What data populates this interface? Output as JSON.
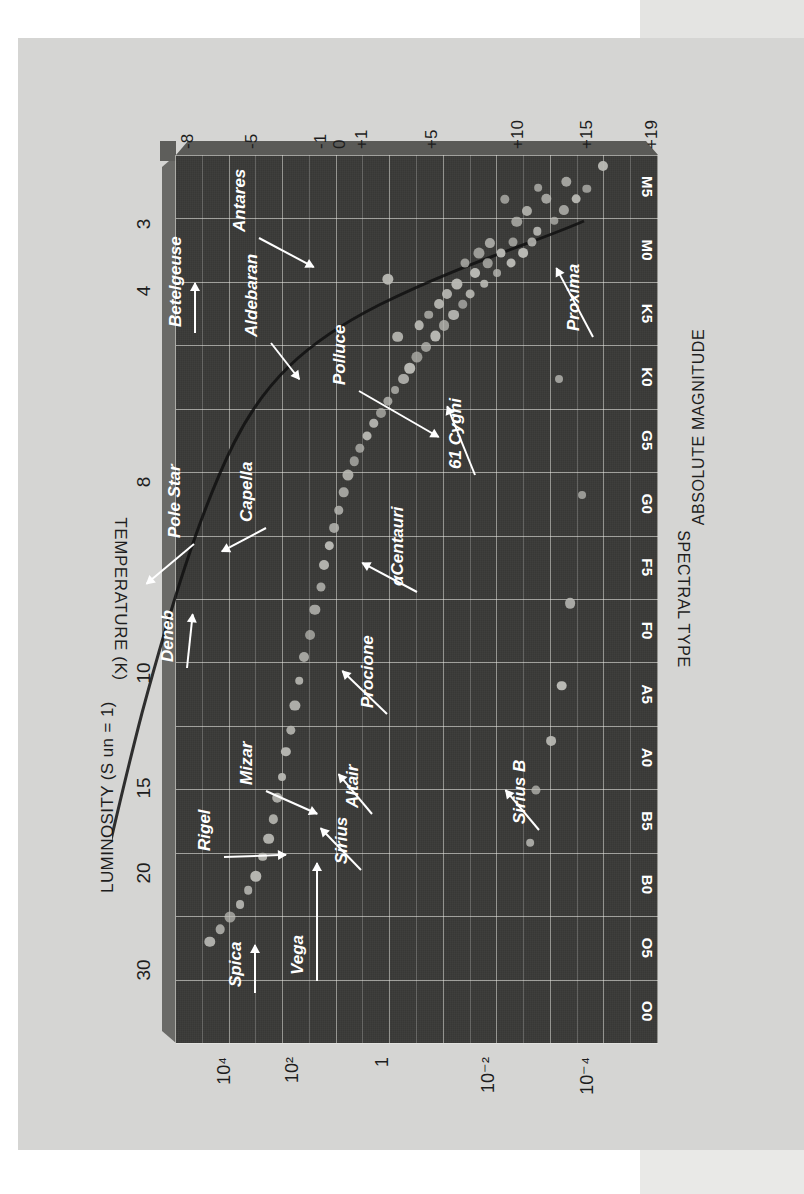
{
  "figure": {
    "title_spectral": "SPECTRAL TYPE",
    "title_absmag": "ABSOLUTE MAGNITUDE",
    "title_temp": "TEMPERATURE (K)",
    "title_lum": "LUMINOSITY (S un = 1)"
  },
  "chart_data": {
    "type": "scatter",
    "title": "",
    "xlabel": "SPECTRAL TYPE",
    "ylabel": "ABSOLUTE MAGNITUDE",
    "xlabel_secondary": "TEMPERATURE (K)",
    "ylabel_secondary": "LUMINOSITY (S un = 1)",
    "grid": true,
    "legend": "none",
    "spectral_types": [
      "M5",
      "M0",
      "K5",
      "K0",
      "G5",
      "G0",
      "F5",
      "F0",
      "A5",
      "A0",
      "B5",
      "B0",
      "O5",
      "O0"
    ],
    "absolute_magnitude_ticks": [
      "+19",
      "+15",
      "+10",
      "+5",
      "+1",
      "0",
      "-1",
      "-5",
      "-8"
    ],
    "absolute_magnitude_values": [
      19,
      15,
      10,
      5,
      1,
      0,
      -1,
      -5,
      -8
    ],
    "luminosity_ticks": [
      "10⁻⁴",
      "10⁻²",
      "1",
      "10²",
      "10⁴"
    ],
    "temperature_ticks": [
      "3",
      "4",
      "8",
      "10",
      "15",
      "20",
      "30"
    ],
    "ylim_magnitude": [
      19,
      -8
    ],
    "named_stars": [
      {
        "name": "Proxima",
        "spectral": "M5",
        "magnitude": 15.5
      },
      {
        "name": "Sirius B",
        "spectral": "A5",
        "magnitude": 11.4
      },
      {
        "name": "61 Cygni",
        "spectral": "K5",
        "magnitude": 7.5
      },
      {
        "name": "αCentauri",
        "spectral": "G0",
        "magnitude": 4.4
      },
      {
        "name": "Procione",
        "spectral": "F5",
        "magnitude": 2.7
      },
      {
        "name": "Altair",
        "spectral": "A5",
        "magnitude": 2.2
      },
      {
        "name": "Sirius",
        "spectral": "A0",
        "magnitude": 1.4
      },
      {
        "name": "Vega",
        "spectral": "A0",
        "magnitude": 0.5
      },
      {
        "name": "Mizar",
        "spectral": "A0",
        "magnitude": 0.3
      },
      {
        "name": "Polluce",
        "spectral": "K0",
        "magnitude": 1.0
      },
      {
        "name": "Aldebaran",
        "spectral": "K5",
        "magnitude": -0.7
      },
      {
        "name": "Capella",
        "spectral": "G5",
        "magnitude": -0.6
      },
      {
        "name": "Antares",
        "spectral": "M0",
        "magnitude": -4.5
      },
      {
        "name": "Betelgeuse",
        "spectral": "M0",
        "magnitude": -5.6
      },
      {
        "name": "Pole Star",
        "spectral": "F5",
        "magnitude": -4.6
      },
      {
        "name": "Deneb",
        "spectral": "A0",
        "magnitude": -7.2
      },
      {
        "name": "Rigel",
        "spectral": "B5",
        "magnitude": -7.1
      },
      {
        "name": "Spica",
        "spectral": "B0",
        "magnitude": -3.4
      }
    ],
    "points": [
      [
        0.012,
        0.115
      ],
      [
        0.038,
        0.148
      ],
      [
        0.049,
        0.17
      ],
      [
        0.03,
        0.19
      ],
      [
        0.062,
        0.196
      ],
      [
        0.074,
        0.215
      ],
      [
        0.049,
        0.232
      ],
      [
        0.037,
        0.248
      ],
      [
        0.086,
        0.25
      ],
      [
        0.098,
        0.262
      ],
      [
        0.063,
        0.272
      ],
      [
        0.11,
        0.28
      ],
      [
        0.075,
        0.293
      ],
      [
        0.098,
        0.3
      ],
      [
        0.122,
        0.305
      ],
      [
        0.05,
        0.318
      ],
      [
        0.11,
        0.325
      ],
      [
        0.133,
        0.334
      ],
      [
        0.099,
        0.348
      ],
      [
        0.122,
        0.353
      ],
      [
        0.145,
        0.36
      ],
      [
        0.11,
        0.372
      ],
      [
        0.133,
        0.38
      ],
      [
        0.156,
        0.39
      ],
      [
        0.122,
        0.4
      ],
      [
        0.168,
        0.405
      ],
      [
        0.145,
        0.418
      ],
      [
        0.18,
        0.424
      ],
      [
        0.156,
        0.438
      ],
      [
        0.192,
        0.444
      ],
      [
        0.168,
        0.455
      ],
      [
        0.204,
        0.462
      ],
      [
        0.18,
        0.476
      ],
      [
        0.216,
        0.482
      ],
      [
        0.192,
        0.495
      ],
      [
        0.228,
        0.5
      ],
      [
        0.24,
        0.515
      ],
      [
        0.252,
        0.528
      ],
      [
        0.205,
        0.54
      ],
      [
        0.265,
        0.546
      ],
      [
        0.277,
        0.56
      ],
      [
        0.29,
        0.574
      ],
      [
        0.302,
        0.59
      ],
      [
        0.316,
        0.604
      ],
      [
        0.33,
        0.618
      ],
      [
        0.345,
        0.63
      ],
      [
        0.36,
        0.644
      ],
      [
        0.38,
        0.652
      ],
      [
        0.4,
        0.662
      ],
      [
        0.42,
        0.672
      ],
      [
        0.44,
        0.682
      ],
      [
        0.462,
        0.692
      ],
      [
        0.486,
        0.7
      ],
      [
        0.512,
        0.712
      ],
      [
        0.54,
        0.722
      ],
      [
        0.565,
        0.734
      ],
      [
        0.592,
        0.744
      ],
      [
        0.62,
        0.754
      ],
      [
        0.648,
        0.762
      ],
      [
        0.672,
        0.772
      ],
      [
        0.7,
        0.78
      ],
      [
        0.724,
        0.79
      ],
      [
        0.748,
        0.798
      ],
      [
        0.77,
        0.808
      ],
      [
        0.79,
        0.82
      ],
      [
        0.812,
        0.834
      ],
      [
        0.828,
        0.85
      ],
      [
        0.844,
        0.868
      ],
      [
        0.858,
        0.888
      ],
      [
        0.872,
        0.908
      ],
      [
        0.886,
        0.93
      ],
      [
        0.14,
        0.56
      ],
      [
        0.252,
        0.205
      ],
      [
        0.383,
        0.158
      ],
      [
        0.505,
        0.182
      ],
      [
        0.598,
        0.2
      ],
      [
        0.66,
        0.222
      ],
      [
        0.715,
        0.253
      ],
      [
        0.775,
        0.266
      ]
    ]
  },
  "icons": {
    "arrow": "leader-arrow"
  }
}
